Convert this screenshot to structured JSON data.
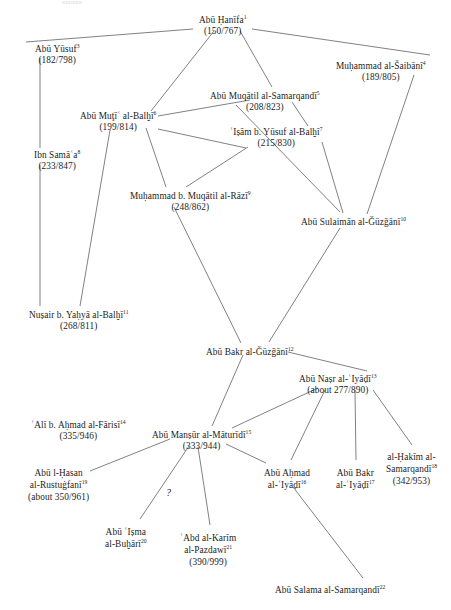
{
  "diagram": {
    "title_fragment": "nnnnnn",
    "canvas": {
      "width": 451,
      "height": 610
    },
    "line_color": "#4a4a4a",
    "text_color": "#1c1c1c",
    "background": "#ffffff",
    "annotation_qmark": "?"
  },
  "nodes": [
    {
      "id": "abu-hanifa",
      "name": "Abū Ḥanīfa",
      "sup": "1",
      "date": "(150/767)",
      "x": 222,
      "y": 14,
      "align": "center"
    },
    {
      "id": "abu-yusuf",
      "name": "Abū Yūsuf",
      "sup": "3",
      "date": "(182/798)",
      "x": 57,
      "y": 43,
      "align": "center"
    },
    {
      "id": "muhammad-al-saibani",
      "name": "Muḥammad al-Šaibānī",
      "sup": "4",
      "date": "(189/805)",
      "x": 381,
      "y": 60,
      "align": "center"
    },
    {
      "id": "abu-muqatil",
      "name": "Abū Muqātil al-Samarqandī",
      "sup": "5",
      "date": "(208/823)",
      "x": 265,
      "y": 90,
      "align": "center"
    },
    {
      "id": "abu-muti",
      "name": "Abū Muţīʿ al-Balḫī",
      "sup": "6",
      "date": "(199/814)",
      "x": 118,
      "y": 110,
      "align": "center"
    },
    {
      "id": "isam-b-yusuf",
      "name": "ʿIṣām b. Yūsuf al-Balḫī",
      "sup": "7",
      "date": "(215/830)",
      "x": 276,
      "y": 126,
      "align": "center"
    },
    {
      "id": "ibn-samaa",
      "name": "Ibn Samāʿa",
      "sup": "8",
      "date": "(233/847)",
      "x": 57,
      "y": 149,
      "align": "center"
    },
    {
      "id": "muhammad-b-muqatil",
      "name": "Muḥammad b. Muqātil al-Rāzī",
      "sup": "9",
      "date": "(248/862)",
      "x": 190,
      "y": 190,
      "align": "center"
    },
    {
      "id": "abu-sulaiman",
      "name": "Abū Sulaimān al-Ǧūzǧānī",
      "sup": "10",
      "date": "",
      "x": 353,
      "y": 216,
      "align": "center"
    },
    {
      "id": "nusair-b-yahya",
      "name": "Nuṣair b. Yaḥyā al-Balḫī",
      "sup": "11",
      "date": "(268/811)",
      "x": 78,
      "y": 309,
      "align": "center"
    },
    {
      "id": "abu-bakr-al-guzgani",
      "name": "Abū Bakr al-Ǧūzǧānī",
      "sup": "12",
      "date": "",
      "x": 250,
      "y": 346,
      "align": "center"
    },
    {
      "id": "abu-nasr-al-iyadi",
      "name": "Abū Naṣr al-ʿIyāḍī",
      "sup": "13",
      "date": "(about 277/890)",
      "x": 338,
      "y": 373,
      "align": "center"
    },
    {
      "id": "ali-b-ahmad-al-farisi",
      "name": "ʿAlī b. Aḥmad al-Fārisī",
      "sup": "14",
      "date": "(335/946)",
      "x": 78,
      "y": 419,
      "align": "center"
    },
    {
      "id": "abu-mansur-al-maturidi",
      "name": "Abū Manṣūr al-Māturīdī",
      "sup": "15",
      "date": "(333/944)",
      "x": 201,
      "y": 429,
      "align": "center"
    },
    {
      "id": "abu-ahmad-al-iyadi",
      "name": "Abū Aḥmad\nal-ʿIyāḍī",
      "sup": "16",
      "date": "",
      "x": 287,
      "y": 468,
      "align": "center"
    },
    {
      "id": "abu-bakr-al-iyadi",
      "name": "Abū Bakr\nal-ʿIyāḍī",
      "sup": "17",
      "date": "",
      "x": 355,
      "y": 468,
      "align": "center"
    },
    {
      "id": "al-hakim-al-samarqandi",
      "name": "al-Ḥakīm al-\nSamarqandī",
      "sup": "18",
      "date": "(342/953)",
      "x": 411,
      "y": 452,
      "align": "center"
    },
    {
      "id": "abu-l-hasan-al-rustugfani",
      "name": "Abū l-Ḥasan\nal-Rustuġfanī",
      "sup": "19",
      "date": "(about 350/961)",
      "x": 58,
      "y": 468,
      "align": "center"
    },
    {
      "id": "abu-isma-al-buhari",
      "name": "Abū ʿIṣma\nal-Buḫārī",
      "sup": "20",
      "date": "",
      "x": 126,
      "y": 527,
      "align": "center"
    },
    {
      "id": "abd-al-karim-al-pazdawi",
      "name": "ʿAbd al-Karīm\nal-Pazdawī",
      "sup": "21",
      "date": "(390/999)",
      "x": 208,
      "y": 533,
      "align": "center"
    },
    {
      "id": "abu-salama-al-samarqandi",
      "name": "Abū Salama al-Samarqandī",
      "sup": "22",
      "date": "",
      "x": 330,
      "y": 584,
      "align": "center"
    }
  ],
  "edges": [
    {
      "id": "e1",
      "from": "abu-hanifa",
      "to": "abu-yusuf",
      "x1": 193,
      "y1": 29,
      "x2": 26,
      "y2": 42
    },
    {
      "id": "e2",
      "from": "abu-hanifa",
      "to": "muhammad-al-saibani",
      "x1": 252,
      "y1": 29,
      "x2": 430,
      "y2": 55
    },
    {
      "id": "e3",
      "from": "abu-hanifa",
      "to": "abu-muti",
      "x1": 214,
      "y1": 31,
      "x2": 151,
      "y2": 111
    },
    {
      "id": "e4",
      "from": "abu-hanifa",
      "to": "abu-muqatil",
      "x1": 240,
      "y1": 31,
      "x2": 272,
      "y2": 87
    },
    {
      "id": "e5",
      "from": "abu-yusuf",
      "to": "ibn-samaa",
      "x1": 40,
      "y1": 58,
      "x2": 40,
      "y2": 148
    },
    {
      "id": "e6",
      "from": "muhammad-al-saibani",
      "to": "abu-sulaiman",
      "x1": 414,
      "y1": 75,
      "x2": 367,
      "y2": 214
    },
    {
      "id": "e7",
      "from": "abu-muqatil",
      "to": "abu-muti",
      "x1": 250,
      "y1": 100,
      "x2": 158,
      "y2": 116
    },
    {
      "id": "e8",
      "from": "abu-muqatil",
      "to": "isam-b-yusuf",
      "x1": 292,
      "y1": 102,
      "x2": 308,
      "y2": 126
    },
    {
      "id": "e9",
      "from": "abu-muti",
      "to": "muhammad-b-muqatil",
      "x1": 146,
      "y1": 128,
      "x2": 166,
      "y2": 187
    },
    {
      "id": "e10",
      "from": "abu-muti",
      "to": "isam-b-yusuf",
      "x1": 158,
      "y1": 129,
      "x2": 246,
      "y2": 148
    },
    {
      "id": "e11",
      "from": "abu-muti",
      "to": "nusair-b-yahya",
      "x1": 110,
      "y1": 130,
      "x2": 80,
      "y2": 306
    },
    {
      "id": "e12",
      "from": "isam-b-yusuf",
      "to": "abu-sulaiman",
      "x1": 322,
      "y1": 142,
      "x2": 343,
      "y2": 213
    },
    {
      "id": "e13",
      "from": "isam-b-yusuf",
      "to": "muhammad-b-muqatil",
      "x1": 248,
      "y1": 147,
      "x2": 186,
      "y2": 187
    },
    {
      "id": "e14",
      "from": "abu-muqatil",
      "to": "abu-sulaiman",
      "x1": 236,
      "y1": 105,
      "x2": 340,
      "y2": 212
    },
    {
      "id": "e15",
      "from": "ibn-samaa",
      "to": "nusair-b-yahya",
      "x1": 40,
      "y1": 165,
      "x2": 40,
      "y2": 306
    },
    {
      "id": "e16",
      "from": "muhammad-b-muqatil",
      "to": "abu-bakr-al-guzgani",
      "x1": 174,
      "y1": 207,
      "x2": 241,
      "y2": 343
    },
    {
      "id": "e17",
      "from": "abu-sulaiman",
      "to": "abu-bakr-al-guzgani",
      "x1": 340,
      "y1": 228,
      "x2": 269,
      "y2": 342
    },
    {
      "id": "e18",
      "from": "abu-bakr-al-guzgani",
      "to": "abu-nasr-al-iyadi",
      "x1": 288,
      "y1": 352,
      "x2": 367,
      "y2": 371
    },
    {
      "id": "e19",
      "from": "abu-bakr-al-guzgani",
      "to": "abu-mansur-al-maturidi",
      "x1": 243,
      "y1": 355,
      "x2": 212,
      "y2": 426
    },
    {
      "id": "e20",
      "from": "abu-nasr-al-iyadi",
      "to": "abu-mansur-al-maturidi",
      "x1": 318,
      "y1": 388,
      "x2": 232,
      "y2": 428
    },
    {
      "id": "e21",
      "from": "abu-nasr-al-iyadi",
      "to": "abu-ahmad-al-iyadi",
      "x1": 325,
      "y1": 390,
      "x2": 291,
      "y2": 460
    },
    {
      "id": "e22",
      "from": "abu-nasr-al-iyadi",
      "to": "abu-bakr-al-iyadi",
      "x1": 355,
      "y1": 390,
      "x2": 356,
      "y2": 460
    },
    {
      "id": "e23",
      "from": "abu-nasr-al-iyadi",
      "to": "al-hakim-al-samarqandi",
      "x1": 373,
      "y1": 390,
      "x2": 412,
      "y2": 445
    },
    {
      "id": "e24",
      "from": "abu-mansur-al-maturidi",
      "to": "abu-l-hasan-al-rustugfani",
      "x1": 170,
      "y1": 439,
      "x2": 90,
      "y2": 471
    },
    {
      "id": "e25",
      "from": "abu-mansur-al-maturidi",
      "to": "abu-isma-al-buhari",
      "x1": 189,
      "y1": 446,
      "x2": 140,
      "y2": 519
    },
    {
      "id": "e26",
      "from": "abu-mansur-al-maturidi",
      "to": "abd-al-karim-al-pazdawi",
      "x1": 198,
      "y1": 447,
      "x2": 210,
      "y2": 525
    },
    {
      "id": "e27",
      "from": "abu-mansur-al-maturidi",
      "to": "abu-ahmad-al-iyadi",
      "x1": 226,
      "y1": 444,
      "x2": 266,
      "y2": 463
    },
    {
      "id": "e28",
      "from": "abu-ahmad-al-iyadi",
      "to": "abu-salama-al-samarqandi",
      "x1": 293,
      "y1": 487,
      "x2": 363,
      "y2": 578
    }
  ],
  "qmark_position": {
    "x": 166,
    "y": 487
  }
}
